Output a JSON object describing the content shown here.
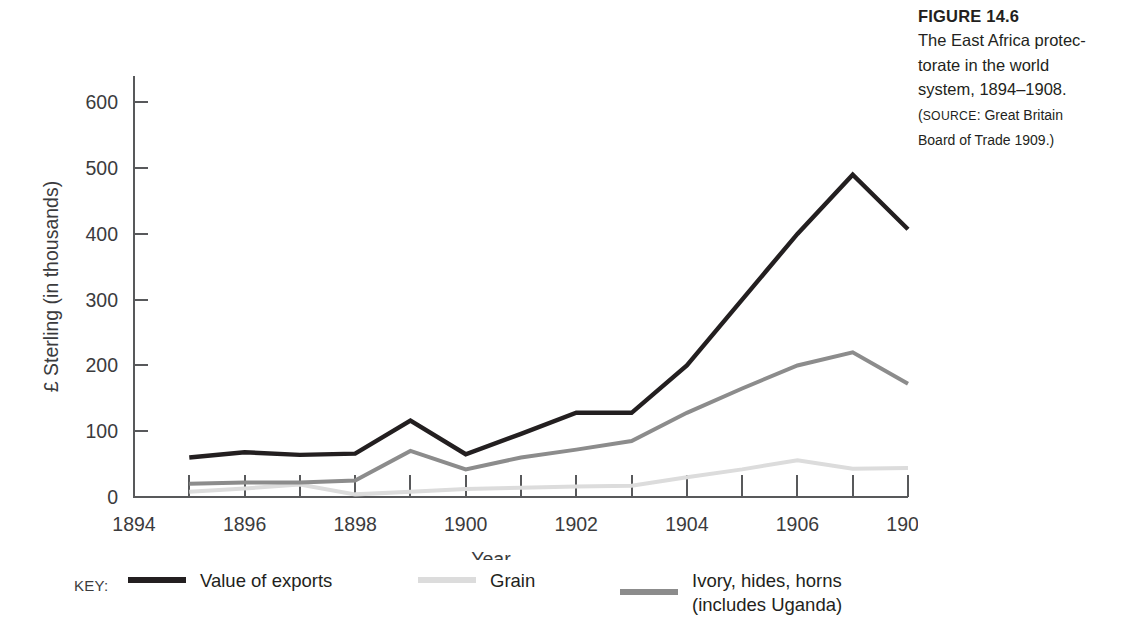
{
  "caption": {
    "figure_number": "FIGURE 14.6",
    "body_lines": [
      "The East Africa protec-",
      "torate in the world",
      "system, 1894–1908."
    ],
    "source_prefix": "(",
    "source_label": "SOURCE",
    "source_text": ": Great Britain",
    "source_line2": "Board of Trade 1909.)"
  },
  "legend": {
    "key_word": "KEY:",
    "entries": [
      {
        "label": "Value of exports",
        "label2": "",
        "color": "#231f20"
      },
      {
        "label": "Grain",
        "label2": "",
        "color": "#dcdcdc"
      },
      {
        "label": "Ivory, hides, horns",
        "label2": "(includes Uganda)",
        "color": "#8c8c8c"
      }
    ]
  },
  "chart_data": {
    "type": "line",
    "xlabel": "Year",
    "ylabel": "£ Sterling (in thousands)",
    "xlim": [
      1894,
      1908
    ],
    "ylim": [
      0,
      640
    ],
    "grid": false,
    "legend_position": "below",
    "xticks": [
      1894,
      1896,
      1898,
      1900,
      1902,
      1904,
      1906,
      1908
    ],
    "xtick_labels": [
      "1894",
      "1896",
      "1898",
      "1900",
      "1902",
      "1904",
      "1906",
      "1908"
    ],
    "xminor_ticks": [
      1895,
      1896,
      1897,
      1898,
      1899,
      1900,
      1901,
      1902,
      1903,
      1904,
      1905,
      1906,
      1907,
      1908
    ],
    "yticks": [
      0,
      100,
      200,
      300,
      400,
      500,
      600
    ],
    "ytick_labels": [
      "0",
      "100",
      "200",
      "300",
      "400",
      "500",
      "600"
    ],
    "x": [
      1895,
      1896,
      1897,
      1898,
      1899,
      1900,
      1901,
      1902,
      1903,
      1904,
      1905,
      1906,
      1907,
      1908
    ],
    "series": [
      {
        "name": "Value of exports",
        "color": "#231f20",
        "width": 4.4,
        "values": [
          60,
          68,
          64,
          66,
          116,
          65,
          96,
          128,
          128,
          200,
          300,
          400,
          490,
          407
        ]
      },
      {
        "name": "Ivory, hides, horns (includes Uganda)",
        "color": "#8c8c8c",
        "width": 4.0,
        "values": [
          20,
          22,
          22,
          25,
          70,
          42,
          60,
          72,
          85,
          128,
          165,
          200,
          220,
          172
        ]
      },
      {
        "name": "Grain",
        "color": "#dcdcdc",
        "width": 4.0,
        "values": [
          8,
          13,
          19,
          4,
          8,
          12,
          14,
          16,
          17,
          30,
          42,
          56,
          43,
          44
        ]
      }
    ]
  }
}
